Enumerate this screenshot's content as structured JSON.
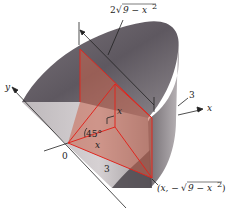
{
  "figure": {
    "colors": {
      "solid_dark": "#5e5860",
      "solid_mid": "#8a8489",
      "solid_light": "#c9c4c6",
      "wedge_fill": "#c8644f",
      "wedge_edge": "#e0261f",
      "axis": "#222222"
    }
  },
  "labels": {
    "top_width": "2√(9 − x²)",
    "top_width_coef": "2",
    "top_width_rad": "9 − x",
    "top_width_exp": "2",
    "radius": "3",
    "x_axis": "x",
    "y_axis": "y",
    "origin": "0",
    "angle": "45°",
    "height_x": "x",
    "base_x": "x",
    "hyp_3": "3",
    "point": "(x, −√(9 − x²))",
    "point_open": "(x, −",
    "point_rad": "9 − x",
    "point_exp": "2",
    "point_close": ")"
  }
}
